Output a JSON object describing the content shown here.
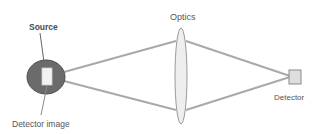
{
  "diagram": {
    "labels": {
      "source": "Source",
      "optics": "Optics",
      "detector": "Detector",
      "detector_image": "Detector image"
    },
    "colors": {
      "ray": "#a9a9a9",
      "source_fill": "#6b6b6b",
      "source_stroke": "#4d4d4d",
      "lens_fill": "#eeeeee",
      "lens_stroke": "#9a9a9a",
      "detector_fill": "#dedede",
      "detector_stroke": "#8a8a8a",
      "text": "#555555"
    },
    "components": [
      "source",
      "optics",
      "detector",
      "detector-image"
    ]
  }
}
